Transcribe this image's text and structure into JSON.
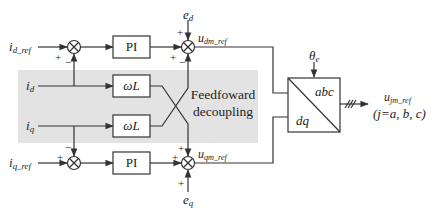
{
  "diagram": {
    "type": "block-diagram",
    "title": "",
    "colors": {
      "line": "#333333",
      "shade": "#e3e3e3",
      "box_fill": "#ffffff"
    },
    "inputs": {
      "id_ref": {
        "main": "i",
        "sub": "d_ref"
      },
      "id": {
        "main": "i",
        "sub": "d"
      },
      "iq": {
        "main": "i",
        "sub": "q"
      },
      "iq_ref": {
        "main": "i",
        "sub": "q_ref"
      },
      "ed": {
        "main": "e",
        "sub": "d"
      },
      "eq": {
        "main": "e",
        "sub": "q"
      },
      "theta": {
        "main": "θ",
        "sub": "e"
      }
    },
    "blocks": {
      "pi_top": "PI",
      "pi_bottom": "PI",
      "wl_top": "ωL",
      "wl_bottom": "ωL",
      "transform_abc": "abc",
      "transform_dq": "dq"
    },
    "signals": {
      "udm_ref": {
        "main": "u",
        "sub": "dm_ref"
      },
      "uqm_ref": {
        "main": "u",
        "sub": "qm_ref"
      },
      "ujm_ref": {
        "main": "u",
        "sub": "jm_ref"
      },
      "j_def": "(j=a, b, c)"
    },
    "region_label": {
      "line1": "Feedfoward",
      "line2": "decoupling"
    },
    "signs": {
      "sum_d_ref_plus": "+",
      "sum_d_minus": "−",
      "sum_q_ref_plus": "+",
      "sum_q_minus": "−",
      "sum_udm_ed_plus": "+",
      "sum_udm_pi_plus": "+",
      "sum_udm_cross_minus": "−",
      "sum_uqm_cross_plus": "+",
      "sum_uqm_pi_plus": "+",
      "sum_uqm_eq_plus": "+"
    },
    "nodes": [
      {
        "id": "sum1",
        "type": "summer",
        "label": "⊗"
      },
      {
        "id": "pi1",
        "type": "block",
        "label": "PI"
      },
      {
        "id": "sum2",
        "type": "summer",
        "label": "⊗"
      },
      {
        "id": "wl1",
        "type": "block",
        "label": "ωL"
      },
      {
        "id": "wl2",
        "type": "block",
        "label": "ωL"
      },
      {
        "id": "sum3",
        "type": "summer",
        "label": "⊗"
      },
      {
        "id": "pi2",
        "type": "block",
        "label": "PI"
      },
      {
        "id": "sum4",
        "type": "summer",
        "label": "⊗"
      },
      {
        "id": "dq_abc",
        "type": "block",
        "label": "dq/abc"
      }
    ],
    "edges": [
      {
        "from": "i_d_ref",
        "to": "sum1",
        "sign": "+"
      },
      {
        "from": "i_d",
        "to": "sum1",
        "sign": "−"
      },
      {
        "from": "sum1",
        "to": "pi1"
      },
      {
        "from": "pi1",
        "to": "sum2",
        "sign": "+"
      },
      {
        "from": "e_d",
        "to": "sum2",
        "sign": "+"
      },
      {
        "from": "wl2",
        "to": "sum2",
        "sign": "−"
      },
      {
        "from": "i_d",
        "to": "wl1"
      },
      {
        "from": "i_q",
        "to": "wl2"
      },
      {
        "from": "i_q",
        "to": "sum3",
        "sign": "−"
      },
      {
        "from": "i_q_ref",
        "to": "sum3",
        "sign": "+"
      },
      {
        "from": "sum3",
        "to": "pi2"
      },
      {
        "from": "pi2",
        "to": "sum4",
        "sign": "+"
      },
      {
        "from": "wl1",
        "to": "sum4",
        "sign": "+"
      },
      {
        "from": "e_q",
        "to": "sum4",
        "sign": "+"
      },
      {
        "from": "sum2",
        "to": "dq_abc",
        "label": "u_dm_ref"
      },
      {
        "from": "sum4",
        "to": "dq_abc",
        "label": "u_qm_ref"
      },
      {
        "from": "theta_e",
        "to": "dq_abc"
      },
      {
        "from": "dq_abc",
        "to": "u_jm_ref",
        "label": "3-phase"
      }
    ]
  }
}
